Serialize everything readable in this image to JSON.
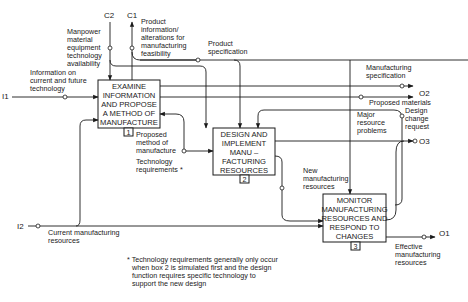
{
  "boundary_labels": {
    "c2": "C2",
    "c1": "C1",
    "i1": "I1",
    "i2": "I2",
    "o2": "O2",
    "o3": "O3",
    "o1": "O1"
  },
  "boxes": [
    {
      "number": "1",
      "lines": [
        "EXAMINE",
        "INFORMATION",
        "AND PROPOSE",
        "A METHOD OF",
        "MANUFACTURE"
      ]
    },
    {
      "number": "2",
      "lines": [
        "DESIGN AND",
        "IMPLEMENT",
        "MANU –",
        "FACTURING",
        "RESOURCES"
      ]
    },
    {
      "number": "3",
      "lines": [
        "MONITOR",
        "MANUFACTURING",
        "RESOURCES AND",
        "RESPOND TO",
        "CHANGES"
      ]
    }
  ],
  "arrow_labels": {
    "manpower": [
      "Manpower",
      "material",
      "equipment",
      "technology",
      "availability"
    ],
    "product_info": [
      "Product",
      "information/",
      "alterations for",
      "manufacturing",
      "feasibility"
    ],
    "product_spec": [
      "Product",
      "specification"
    ],
    "info_current": [
      "Information on",
      "current and future",
      "technology"
    ],
    "mfg_spec": [
      "Manufacturing",
      "specification"
    ],
    "proposed_materials": "Proposed materials",
    "major_resource": [
      "Major",
      "resource",
      "problems"
    ],
    "design_change": [
      "Design",
      "change",
      "request"
    ],
    "proposed_method": [
      "Proposed",
      "method of",
      "manufacture"
    ],
    "tech_req": [
      "Technology",
      "requirements *"
    ],
    "new_mfg": [
      "New",
      "manufacturing",
      "resources"
    ],
    "current_mfg": [
      "Current manufacturing",
      "resources"
    ],
    "effective_mfg": [
      "Effective",
      "manufacturing",
      "resources"
    ]
  },
  "footnote": [
    "* Technology requirements generally only occur",
    "when box 2 is simulated first and the design",
    "function requires specific technology to",
    "support the new design"
  ]
}
